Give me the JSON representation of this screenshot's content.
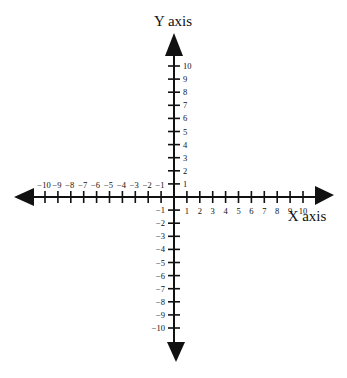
{
  "diagram": {
    "type": "coordinate-plane",
    "x_axis_label": "X axis",
    "y_axis_label": "Y axis",
    "x_range": [
      -10,
      10
    ],
    "y_range": [
      -10,
      10
    ],
    "x_ticks_positive": [
      "1",
      "2",
      "3",
      "4",
      "5",
      "6",
      "7",
      "8",
      "9",
      "10"
    ],
    "x_ticks_negative": [
      "-1",
      "-2",
      "-3",
      "-4",
      "-5",
      "-6",
      "-7",
      "-8",
      "-9",
      "-10"
    ],
    "y_ticks_positive": [
      "1",
      "2",
      "3",
      "4",
      "5",
      "6",
      "7",
      "8",
      "9",
      "10"
    ],
    "y_ticks_negative": [
      "−1",
      "−2",
      "−3",
      "−4",
      "−5",
      "−6",
      "−7",
      "−8",
      "−9",
      "−10"
    ],
    "x_ticks_negative_display": [
      "−1",
      "−2",
      "−3",
      "−4",
      "−5",
      "−6",
      "−7",
      "−8",
      "−9",
      "−10"
    ],
    "axis_color": "#111111"
  }
}
